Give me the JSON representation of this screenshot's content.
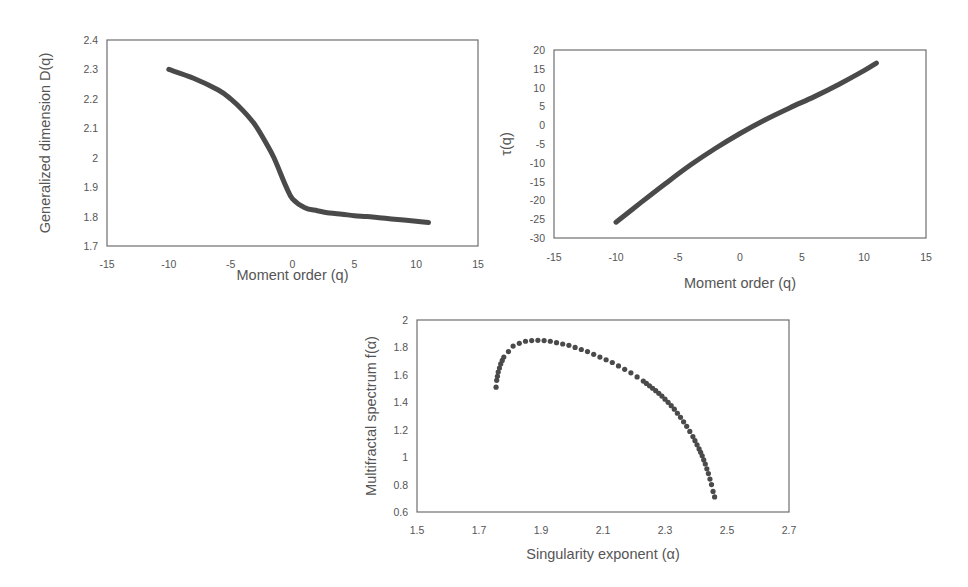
{
  "chart_data": [
    {
      "type": "line",
      "title": "",
      "xlabel": "Moment order (q)",
      "ylabel": "Generalized dimension D(q)",
      "xlim": [
        -15,
        15
      ],
      "ylim": [
        1.7,
        2.4
      ],
      "xticks": [
        "-15",
        "-10",
        "-5",
        "0",
        "5",
        "10",
        "15"
      ],
      "yticks": [
        "1.7",
        "1.8",
        "1.9",
        "2",
        "2.1",
        "2.2",
        "2.3",
        "2.4"
      ],
      "grid": false,
      "legend": null,
      "x": [
        -10,
        -8,
        -6,
        -5,
        -4,
        -3,
        -2,
        -1.5,
        -1,
        -0.5,
        0,
        1,
        2,
        3,
        4,
        5,
        6,
        7,
        8,
        9,
        10,
        11
      ],
      "values": [
        2.3,
        2.27,
        2.23,
        2.2,
        2.16,
        2.11,
        2.04,
        2.0,
        1.95,
        1.9,
        1.86,
        1.83,
        1.82,
        1.812,
        1.808,
        1.803,
        1.8,
        1.796,
        1.792,
        1.788,
        1.784,
        1.78
      ]
    },
    {
      "type": "line",
      "title": "",
      "xlabel": "Moment order (q)",
      "ylabel": "τ(q)",
      "xlim": [
        -15,
        15
      ],
      "ylim": [
        -30,
        20
      ],
      "xticks": [
        "-15",
        "-10",
        "-5",
        "0",
        "5",
        "10",
        "15"
      ],
      "yticks": [
        "-30",
        "-25",
        "-20",
        "-15",
        "-10",
        "-5",
        "0",
        "5",
        "10",
        "15",
        "20"
      ],
      "grid": false,
      "legend": null,
      "x": [
        -10,
        -8,
        -6,
        -4,
        -2,
        0,
        2,
        4,
        6,
        8,
        10,
        11
      ],
      "values": [
        -25.8,
        -20.6,
        -15.5,
        -10.6,
        -6.2,
        -2.2,
        1.4,
        4.6,
        7.6,
        10.9,
        14.5,
        16.5
      ]
    },
    {
      "type": "scatter",
      "title": "",
      "xlabel": "Singularity exponent (α)",
      "ylabel": "Multifractal spectrum f(α)",
      "xlim": [
        1.5,
        2.7
      ],
      "ylim": [
        0.6,
        2.0
      ],
      "xticks": [
        "1.5",
        "1.7",
        "1.9",
        "2.1",
        "2.3",
        "2.5",
        "2.7"
      ],
      "yticks": [
        "0.6",
        "0.8",
        "1",
        "1.2",
        "1.4",
        "1.6",
        "1.8",
        "2"
      ],
      "grid": false,
      "legend": null,
      "x": [
        1.755,
        1.757,
        1.762,
        1.77,
        1.78,
        1.795,
        1.81,
        1.83,
        1.85,
        1.87,
        1.89,
        1.91,
        1.93,
        1.95,
        1.97,
        1.99,
        2.01,
        2.03,
        2.05,
        2.07,
        2.09,
        2.11,
        2.13,
        2.15,
        2.17,
        2.19,
        2.21,
        2.23,
        2.25,
        2.27,
        2.29,
        2.31,
        2.33,
        2.35,
        2.37,
        2.39,
        2.41,
        2.42,
        2.43,
        2.44,
        2.45,
        2.455,
        2.46
      ],
      "values": [
        1.51,
        1.56,
        1.62,
        1.68,
        1.73,
        1.77,
        1.81,
        1.83,
        1.845,
        1.85,
        1.852,
        1.85,
        1.845,
        1.835,
        1.825,
        1.815,
        1.8,
        1.785,
        1.77,
        1.75,
        1.73,
        1.71,
        1.69,
        1.665,
        1.64,
        1.615,
        1.585,
        1.555,
        1.52,
        1.485,
        1.445,
        1.4,
        1.35,
        1.29,
        1.225,
        1.15,
        1.06,
        1.01,
        0.95,
        0.88,
        0.8,
        0.75,
        0.71
      ]
    }
  ]
}
